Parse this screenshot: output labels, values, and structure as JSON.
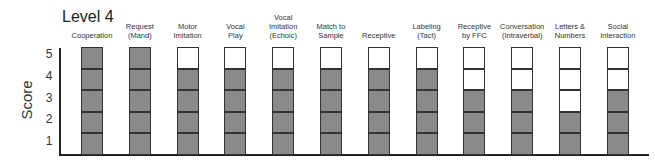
{
  "title": "Level 4",
  "ylabel": "Score",
  "yticks": [
    "1",
    "2",
    "3",
    "4",
    "5"
  ],
  "colors": {
    "filled": "#8a8a8a",
    "empty": "#ffffff",
    "border": "#333333"
  },
  "chart_data": {
    "type": "bar",
    "title": "Level 4",
    "xlabel": "",
    "ylabel": "Score",
    "ylim": [
      0,
      5
    ],
    "yticks": [
      1,
      2,
      3,
      4,
      5
    ],
    "grid": false,
    "style": "stacked unit squares; filled squares indicate score",
    "categories": [
      "Cooperation",
      "Request (Mand)",
      "Motor Imitation",
      "Vocal Play",
      "Vocal Imitation (Echoic)",
      "Match to Sample",
      "Receptive",
      "Labeling (Tact)",
      "Receptive by FFC",
      "Conversation (Intraverbal)",
      "Letters & Numbers",
      "Social Interaction"
    ],
    "values": [
      5,
      5,
      4,
      4,
      4,
      4,
      4,
      4,
      3,
      3,
      2,
      3
    ]
  },
  "labels": [
    "Cooperation",
    "Request\n(Mand)",
    "Motor\nImitation",
    "Vocal\nPlay",
    "Vocal\nImitation\n(Echoic)",
    "Match to\nSample",
    "Receptive",
    "Labeling\n(Tact)",
    "Receptive\nby FFC",
    "Conversation\n(Intraverbal)",
    "Letters &\nNumbers",
    "Social\nInteraction"
  ]
}
